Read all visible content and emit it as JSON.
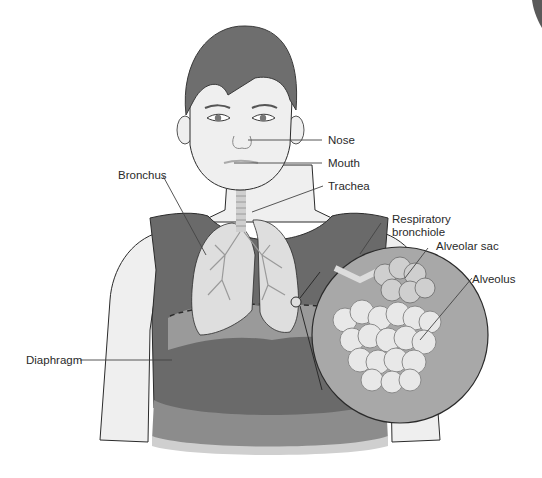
{
  "figure": {
    "colors": {
      "skin": "#efefef",
      "hair": "#6e6e6e",
      "shirt": "#6a6a6a",
      "shirt_hem": "#8c8c8c",
      "lung": "#dedede",
      "diaphragm": "#9a9a9a",
      "magnifier_bg": "#a8a8a8",
      "alveoli": "#e2e2e2",
      "outline": "#2b2b2b",
      "leader_line": "#444444"
    }
  },
  "labels": {
    "nose": "Nose",
    "mouth": "Mouth",
    "trachea": "Trachea",
    "bronchus": "Bronchus",
    "respiratory_bronchiole_line1": "Respiratory",
    "respiratory_bronchiole_line2": "bronchiole",
    "alveolar_sac": "Alveolar sac",
    "alveolus": "Alveolus",
    "diaphragm": "Diaphragm"
  }
}
